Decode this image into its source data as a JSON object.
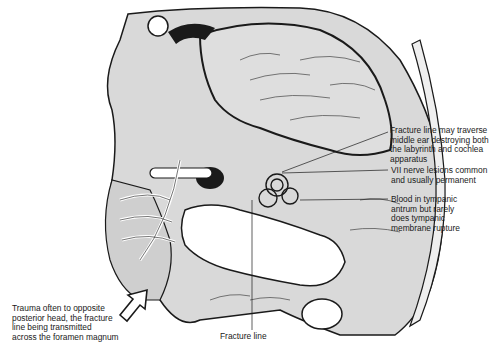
{
  "figure": {
    "colors": {
      "background": "#ffffff",
      "tissue_fill": "#d9d9d9",
      "outline": "#1a1a1a",
      "label_text": "#1a1a1a"
    }
  },
  "labels": {
    "fracture_middle_ear": "Fracture line may traverse\nmiddle ear destroying both\nthe labyrinth and cochlea\napparatus",
    "vii_nerve": "VII nerve lesions common\nand usually permanent",
    "blood_tympanic": "Blood in tympanic\nantrum but rarely\ndoes tympanic\nmembrane rupture",
    "trauma": "Trauma often to opposite\nposterior head, the fracture\nline being transmitted\nacross the foramen magnum",
    "fracture_line": "Fracture line"
  },
  "icons": {
    "trauma_arrow": "outline-arrow-pointing-up-right"
  }
}
